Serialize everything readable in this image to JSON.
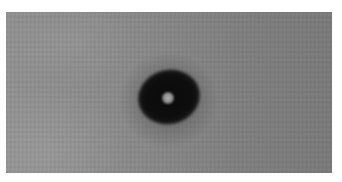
{
  "image": {
    "type": "grayscale-photograph",
    "alt": "Dark elliptical ring with a small bright center on a mottled gray background",
    "colors": {
      "page_background": "#ffffff",
      "background_left": "#929292",
      "background_right": "#7b7b7b",
      "ring_dark": "#0b0b0b",
      "core_light": "#b4b4b4"
    },
    "regions": {
      "photo_box": {
        "x": 6,
        "y": 12,
        "width": 326,
        "height": 161
      },
      "ring_center": {
        "x": 168,
        "y": 96
      },
      "core_center": {
        "x": 168,
        "y": 98
      }
    }
  }
}
